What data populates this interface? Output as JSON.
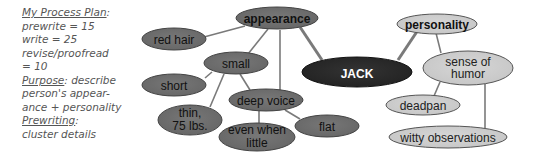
{
  "process_plan": {
    "heading": "My Process Plan",
    "heading_suffix": ":",
    "lines": [
      "prewrite = 15",
      "write = 25",
      "revise/proofread",
      "= 10"
    ],
    "purpose_label": "Purpose",
    "purpose_text": ": describe",
    "purpose_lines": [
      "person's appear-",
      "ance + personality"
    ],
    "prewriting_label": "Prewriting",
    "prewriting_suffix": ":",
    "prewriting_text": "cluster details"
  },
  "cluster": {
    "colors": {
      "center_fill": "#2b2b2b",
      "dark_fill": "#6f6f6f",
      "light_fill": "#cfcfcf",
      "line": "#7a7a7a",
      "outline": "#444444"
    },
    "nodes": {
      "jack": {
        "label": "JACK"
      },
      "appearance": {
        "label": "appearance"
      },
      "red_hair": {
        "label": "red hair"
      },
      "small": {
        "label": "small"
      },
      "short": {
        "label": "short"
      },
      "thin": {
        "label1": "thin,",
        "label2": "75 lbs."
      },
      "deep_voice": {
        "label": "deep voice"
      },
      "even_when_little": {
        "label1": "even when",
        "label2": "little"
      },
      "flat": {
        "label": "flat"
      },
      "personality": {
        "label": "personality"
      },
      "sense_of_humor": {
        "label1": "sense of",
        "label2": "humor"
      },
      "deadpan": {
        "label": "deadpan"
      },
      "witty_observations": {
        "label": "witty observations"
      }
    }
  }
}
